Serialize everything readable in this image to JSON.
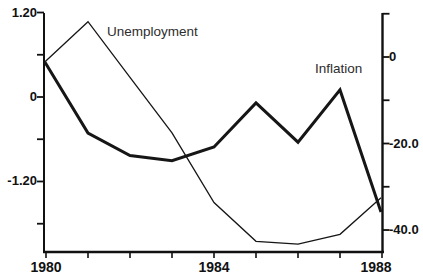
{
  "chart_data": {
    "type": "line",
    "title": "",
    "x_years": [
      1980,
      1981,
      1982,
      1983,
      1984,
      1985,
      1986,
      1987,
      1988
    ],
    "series": [
      {
        "name": "Unemployment",
        "axis": "left",
        "style": "thin",
        "values": [
          0.5,
          1.07,
          0.28,
          -0.51,
          -1.5,
          -2.05,
          -2.09,
          -1.95,
          -1.43
        ]
      },
      {
        "name": "Inflation",
        "axis": "right",
        "style": "thick",
        "values": [
          -1.2,
          -17.6,
          -22.8,
          -24.0,
          -20.8,
          -10.6,
          -19.7,
          -7.6,
          -35.8
        ]
      }
    ],
    "axes": {
      "x": {
        "range": [
          1980,
          1988
        ],
        "ticks": [
          1980,
          1981,
          1982,
          1983,
          1984,
          1985,
          1986,
          1987,
          1988
        ],
        "labels": [
          {
            "v": 1980,
            "t": "1980"
          },
          {
            "v": 1984,
            "t": "1984"
          },
          {
            "v": 1988,
            "t": "1988"
          }
        ]
      },
      "left": {
        "range": [
          -2.2,
          1.2
        ],
        "ticks": [
          1.2,
          0.6,
          0,
          -0.6,
          -1.2,
          -1.8
        ],
        "labels": [
          {
            "v": 1.2,
            "t": "1.20"
          },
          {
            "v": 0,
            "t": "0"
          },
          {
            "v": -1.2,
            "t": "-1.20"
          }
        ]
      },
      "right": {
        "range": [
          -45,
          10
        ],
        "ticks": [
          10,
          0,
          -10,
          -20,
          -30,
          -40
        ],
        "labels": [
          {
            "v": 0,
            "t": "0"
          },
          {
            "v": -20,
            "t": "-20.0"
          },
          {
            "v": -40,
            "t": "-40.0"
          }
        ]
      }
    },
    "legend": "none",
    "grid": false
  },
  "colors": {
    "line": "#161616",
    "axis": "#111111",
    "text": "#111111",
    "background": "#ffffff"
  }
}
